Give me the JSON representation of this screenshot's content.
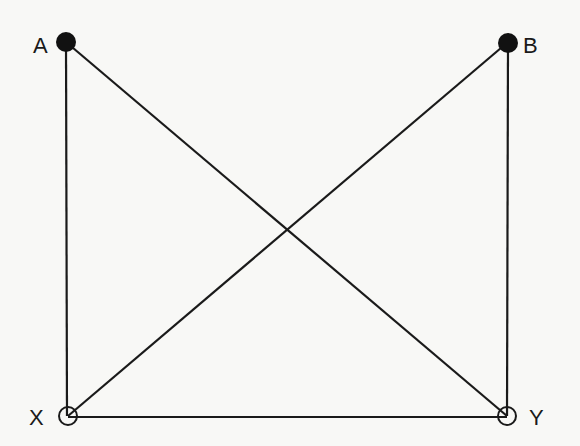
{
  "diagram": {
    "type": "graph",
    "nodes": [
      {
        "id": "A",
        "label": "A",
        "x": 66,
        "y": 42,
        "style": "filled",
        "label_x": 33,
        "label_y": 52
      },
      {
        "id": "B",
        "label": "B",
        "x": 508,
        "y": 42,
        "style": "filled",
        "label_x": 524,
        "label_y": 52
      },
      {
        "id": "X",
        "label": "X",
        "x": 68,
        "y": 416,
        "style": "open",
        "label_x": 29,
        "label_y": 424
      },
      {
        "id": "Y",
        "label": "Y",
        "x": 507,
        "y": 416,
        "style": "open",
        "label_x": 529,
        "label_y": 424
      }
    ],
    "edges": [
      {
        "from": "A",
        "to": "X"
      },
      {
        "from": "B",
        "to": "Y"
      },
      {
        "from": "X",
        "to": "Y"
      },
      {
        "from": "A",
        "to": "Y"
      },
      {
        "from": "B",
        "to": "X"
      }
    ],
    "colors": {
      "line": "#1a1a1a",
      "background": "#f8f8f6"
    }
  }
}
